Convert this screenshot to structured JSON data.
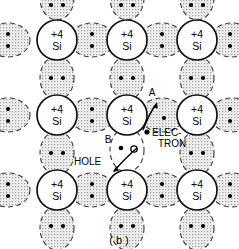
{
  "figure": {
    "caption": "( b )",
    "atom_charge_label": "+4",
    "atom_element_label": "Si",
    "colors": {
      "outline": "#1a1a1a",
      "bond_fill": "#e3e3e3",
      "bond_dash": "#3a3a3a",
      "electron_dot": "#000000",
      "hole_fill": "#ffffff",
      "background": "#ffffff"
    },
    "annotations": [
      {
        "id": "A",
        "label": "A",
        "x": 152,
        "y": 93,
        "describes": "electron-freed-from-covalent-bond"
      },
      {
        "id": "electron",
        "label": "ELEC-",
        "label2": "TRON",
        "x": 165,
        "y": 134,
        "describes": "free-electron-carrier"
      },
      {
        "id": "B",
        "label": "B",
        "x": 108,
        "y": 139,
        "describes": "vacancy-left-behind-in-bond"
      },
      {
        "id": "hole",
        "label": "HOLE",
        "x": 75,
        "y": 161,
        "describes": "hole-carrier"
      }
    ],
    "lattice": {
      "rows": 3,
      "cols": 3,
      "atom_centers_x": [
        57,
        127,
        197
      ],
      "atom_centers_y": [
        40,
        115,
        190
      ],
      "atom_radius": 20,
      "electrons_per_bond": 2
    }
  }
}
